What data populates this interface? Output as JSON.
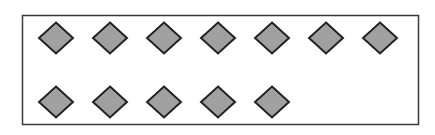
{
  "figure": {
    "shape": "diamond",
    "total_count": 12,
    "rows": [
      {
        "row": 1,
        "count": 7
      },
      {
        "row": 2,
        "count": 5
      }
    ],
    "colors": {
      "background": "#ffffff",
      "frame_stroke": "#3a3a3a",
      "shape_fill": "#a0a0a0",
      "shape_stroke": "#222222"
    }
  }
}
